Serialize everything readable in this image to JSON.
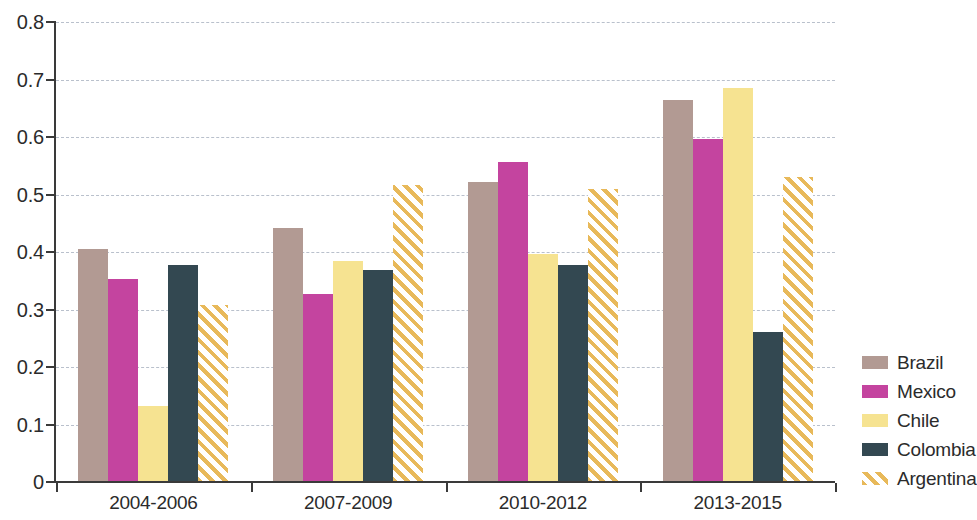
{
  "chart_data": {
    "type": "bar",
    "title": "",
    "subtitle": "",
    "xlabel": "",
    "ylabel": "",
    "categories": [
      "2004-2006",
      "2007-2009",
      "2010-2012",
      "2013-2015"
    ],
    "series": [
      {
        "name": "Brazil",
        "color": "#b29a93",
        "values": [
          0.405,
          0.442,
          0.522,
          0.665
        ]
      },
      {
        "name": "Mexico",
        "color": "#c4449f",
        "values": [
          0.353,
          0.327,
          0.556,
          0.597
        ]
      },
      {
        "name": "Chile",
        "color": "#f6e391",
        "values": [
          0.133,
          0.385,
          0.396,
          0.685
        ]
      },
      {
        "name": "Colombia",
        "color": "#334851",
        "values": [
          0.378,
          0.368,
          0.378,
          0.261
        ]
      },
      {
        "name": "Argentina",
        "color": "#e8b95a",
        "pattern": "diagonal-hatch",
        "values": [
          0.308,
          0.517,
          0.51,
          0.53
        ]
      }
    ],
    "ylim": [
      0,
      0.8
    ],
    "ytick_labels": [
      "0",
      "0.1",
      "0.2",
      "0.3",
      "0.4",
      "0.5",
      "0.6",
      "0.7",
      "0.8"
    ],
    "ytick_values": [
      0,
      0.1,
      0.2,
      0.3,
      0.4,
      0.5,
      0.6,
      0.7,
      0.8
    ],
    "grid": "horizontal-dashed",
    "legend_position": "right",
    "legend_entries": [
      "Brazil",
      "Mexico",
      "Chile",
      "Colombia",
      "Argentina"
    ],
    "grid_color": "#b9c0cc",
    "axis_color": "#3a3a3a",
    "background_color": "#ffffff"
  }
}
